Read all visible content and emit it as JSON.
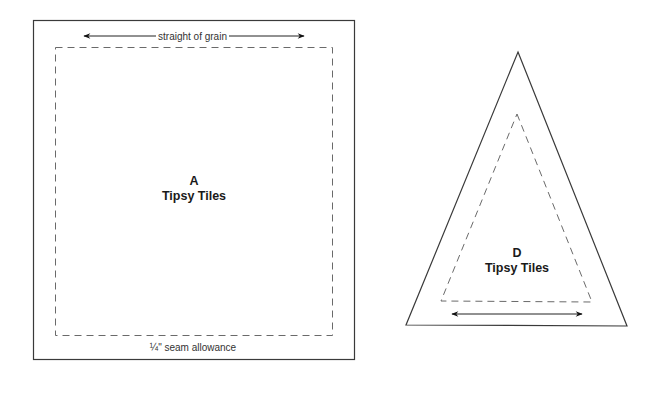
{
  "templates": [
    {
      "id": "A",
      "letter": "A",
      "name": "Tipsy Tiles",
      "shape": "rectangle",
      "grain_label": "straight of grain",
      "seam_label": "¼\" seam allowance"
    },
    {
      "id": "D",
      "letter": "D",
      "name": "Tipsy Tiles",
      "shape": "triangle"
    }
  ],
  "colors": {
    "line": "#3a3a3a",
    "dash": "#6a6a6a",
    "text": "#1a1a1a",
    "background": "#ffffff"
  }
}
